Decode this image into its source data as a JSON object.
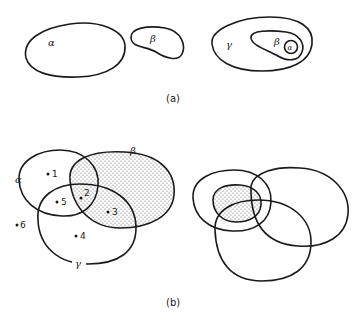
{
  "figure": {
    "part_a": {
      "caption": "(a)",
      "diagrams": [
        {
          "name": "disjoint-set-alpha",
          "label": "α"
        },
        {
          "name": "disjoint-set-beta",
          "label": "β"
        },
        {
          "name": "nested-sets",
          "outer_label": "γ",
          "middle_label": "β",
          "inner_label": "α"
        }
      ]
    },
    "part_b": {
      "caption": "(b)",
      "left": {
        "set_labels": {
          "alpha": "α",
          "beta": "β",
          "gamma": "γ"
        },
        "points": [
          "1",
          "2",
          "3",
          "4",
          "5",
          "6"
        ],
        "shaded_set": "β"
      },
      "right": {
        "description": "three overlapping sets with shaded region"
      }
    },
    "colors": {
      "ink": "#1a1a1a",
      "background": "#ffffff",
      "shading": "#555555"
    }
  }
}
